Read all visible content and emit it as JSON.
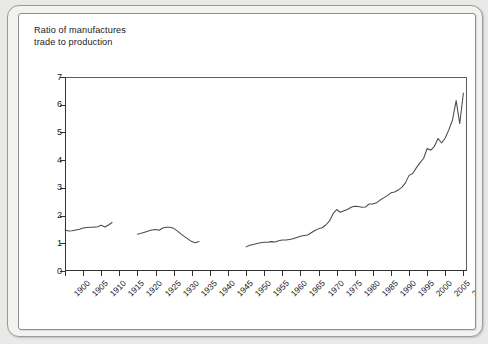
{
  "chart_data": {
    "type": "line",
    "title": "Ratio of manufactures trade to production",
    "title_line1": "Ratio of manufactures",
    "title_line2": "trade to production",
    "xlabel": "",
    "ylabel": "",
    "xlim": [
      1900,
      2011
    ],
    "ylim": [
      0,
      7
    ],
    "grid": false,
    "legend": "none",
    "line_color": "#4a4a4a",
    "axis_color": "#333333",
    "y_ticks": [
      0,
      1,
      2,
      3,
      4,
      5,
      6,
      7
    ],
    "y_tick_labels": [
      "0",
      "1",
      "2",
      "3",
      "4",
      "5",
      "6",
      "7"
    ],
    "x_ticks": [
      1900,
      1905,
      1910,
      1915,
      1920,
      1925,
      1930,
      1935,
      1940,
      1945,
      1950,
      1955,
      1960,
      1965,
      1970,
      1975,
      1980,
      1985,
      1990,
      1995,
      2000,
      2005,
      2010
    ],
    "x_tick_labels": [
      "1900",
      "1905",
      "1910",
      "1915",
      "1920",
      "1925",
      "1930",
      "1935",
      "1940",
      "1945",
      "1950",
      "1955",
      "1960",
      "1965",
      "1970",
      "1975",
      "1980",
      "1985",
      "1990",
      "1995",
      "2000",
      "2005",
      "2010"
    ],
    "series": [
      {
        "name": "Ratio of manufactures trade to production (1900-1913)",
        "x": [
          1900,
          1901,
          1902,
          1903,
          1904,
          1905,
          1906,
          1907,
          1908,
          1909,
          1910,
          1911,
          1912,
          1913
        ],
        "values": [
          1.48,
          1.44,
          1.45,
          1.48,
          1.51,
          1.55,
          1.57,
          1.58,
          1.58,
          1.6,
          1.65,
          1.59,
          1.66,
          1.75
        ]
      },
      {
        "name": "Ratio of manufactures trade to production (1920-1937)",
        "x": [
          1920,
          1921,
          1922,
          1923,
          1924,
          1925,
          1926,
          1927,
          1928,
          1929,
          1930,
          1931,
          1932,
          1933,
          1934,
          1935,
          1936,
          1937
        ],
        "values": [
          1.33,
          1.36,
          1.4,
          1.44,
          1.48,
          1.5,
          1.47,
          1.55,
          1.58,
          1.58,
          1.54,
          1.45,
          1.34,
          1.24,
          1.15,
          1.06,
          1.02,
          1.06
        ]
      },
      {
        "name": "Ratio of manufactures trade to production (1950-2010)",
        "x": [
          1950,
          1951,
          1952,
          1953,
          1954,
          1955,
          1956,
          1957,
          1958,
          1959,
          1960,
          1961,
          1962,
          1963,
          1964,
          1965,
          1966,
          1967,
          1968,
          1969,
          1970,
          1971,
          1972,
          1973,
          1974,
          1975,
          1976,
          1977,
          1978,
          1979,
          1980,
          1981,
          1982,
          1983,
          1984,
          1985,
          1986,
          1987,
          1988,
          1989,
          1990,
          1991,
          1992,
          1993,
          1994,
          1995,
          1996,
          1997,
          1998,
          1999,
          2000,
          2001,
          2002,
          2003,
          2004,
          2005,
          2006,
          2007,
          2008,
          2009,
          2010
        ],
        "values": [
          0.87,
          0.93,
          0.96,
          0.99,
          1.02,
          1.04,
          1.04,
          1.06,
          1.05,
          1.09,
          1.12,
          1.12,
          1.14,
          1.16,
          1.21,
          1.25,
          1.28,
          1.3,
          1.38,
          1.46,
          1.52,
          1.56,
          1.66,
          1.8,
          2.06,
          2.22,
          2.12,
          2.17,
          2.22,
          2.3,
          2.34,
          2.33,
          2.3,
          2.31,
          2.42,
          2.42,
          2.46,
          2.56,
          2.64,
          2.72,
          2.82,
          2.85,
          2.92,
          3.02,
          3.18,
          3.45,
          3.52,
          3.72,
          3.9,
          4.06,
          4.42,
          4.36,
          4.5,
          4.78,
          4.62,
          4.8,
          5.1,
          5.45,
          6.15,
          5.32,
          6.42
        ]
      }
    ]
  }
}
